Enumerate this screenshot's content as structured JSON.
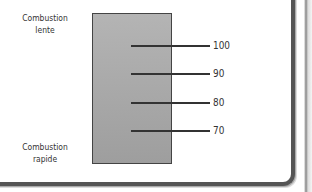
{
  "diagram": {
    "top_label": [
      "Combustion",
      "lente"
    ],
    "bottom_label": [
      "Combustion",
      "rapide"
    ],
    "scale_ticks": [
      {
        "value": "100"
      },
      {
        "value": "90"
      },
      {
        "value": "80"
      },
      {
        "value": "70"
      }
    ],
    "colors": {
      "bar_fill": "#a8a8a8",
      "bar_border": "#444444",
      "tick_line": "#333333",
      "frame_border": "#555555"
    }
  }
}
